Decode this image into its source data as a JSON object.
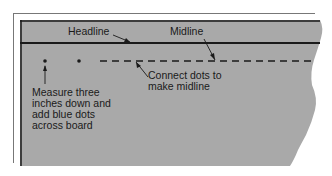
{
  "diagram": {
    "labels": {
      "headline": "Headline",
      "midline": "Midline",
      "connect": "Connect dots to\nmake midline",
      "measure": "Measure three\ninches down and\nadd blue dots\nacross board"
    },
    "colors": {
      "board": "#a9a9a9",
      "line": "#1a1a1a",
      "frame": "#777777"
    }
  }
}
